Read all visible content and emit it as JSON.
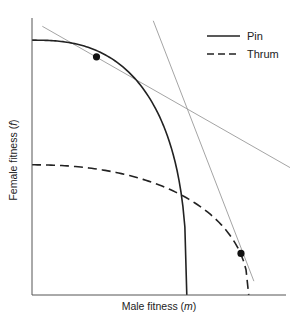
{
  "chart_data": {
    "type": "line",
    "title": "",
    "xlabel": "Male fitness",
    "xlabel_var": "m",
    "ylabel": "Female fitness",
    "ylabel_var": "f",
    "xlim": [
      0,
      1
    ],
    "ylim": [
      0,
      1
    ],
    "grid": false,
    "ticks": false,
    "legend": {
      "placement": "top-right",
      "entries": [
        {
          "label": "Pin",
          "style": "solid"
        },
        {
          "label": "Thrum",
          "style": "dashed"
        }
      ]
    },
    "series": [
      {
        "name": "Pin",
        "style": "solid",
        "x_intercept": 0.6,
        "y_intercept": 0.92,
        "shape": "concave trade-off curve"
      },
      {
        "name": "Thrum",
        "style": "dashed",
        "x_intercept": 0.84,
        "y_intercept": 0.47,
        "shape": "concave trade-off curve"
      }
    ],
    "points": [
      {
        "name": "Pin optimum",
        "x": 0.25,
        "y": 0.86
      },
      {
        "name": "Thrum optimum",
        "x": 0.81,
        "y": 0.15
      }
    ],
    "tangent_lines": [
      {
        "name": "Pin tangent",
        "from": [
          0.04,
          0.97
        ],
        "to": [
          1.0,
          0.46
        ]
      },
      {
        "name": "Thrum tangent",
        "from": [
          0.47,
          0.99
        ],
        "to": [
          0.86,
          0.05
        ]
      }
    ]
  }
}
